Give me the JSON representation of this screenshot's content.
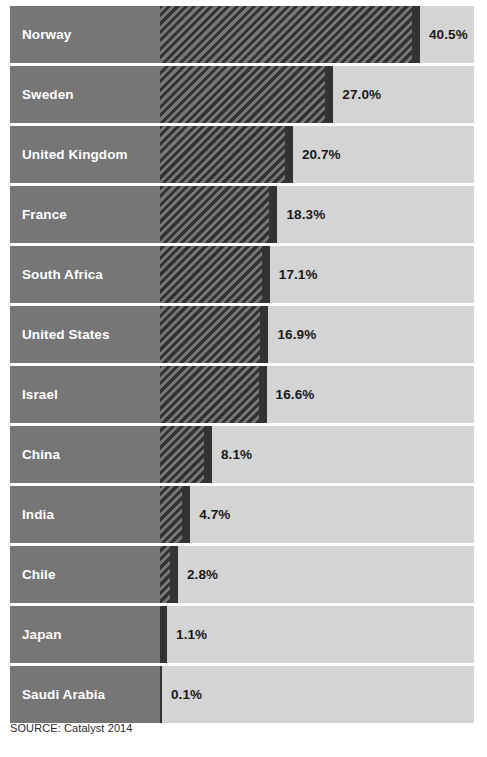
{
  "chart_data": {
    "type": "bar",
    "title": "",
    "subtitle": "",
    "xlabel": "",
    "ylabel": "",
    "orientation": "horizontal",
    "grid": false,
    "legend": null,
    "value_suffix": "%",
    "xlim": [
      0,
      49
    ],
    "categories": [
      "Norway",
      "Sweden",
      "United Kingdom",
      "France",
      "South Africa",
      "United States",
      "Israel",
      "China",
      "India",
      "Chile",
      "Japan",
      "Saudi Arabia"
    ],
    "values": [
      40.5,
      27.0,
      20.7,
      18.3,
      17.1,
      16.9,
      16.6,
      8.1,
      4.7,
      2.8,
      1.1,
      0.1
    ],
    "labels": [
      "40.5%",
      "27.0%",
      "20.7%",
      "18.3%",
      "17.1%",
      "16.9%",
      "16.6%",
      "8.1%",
      "4.7%",
      "2.8%",
      "1.1%",
      "0.1%"
    ],
    "source": "SOURCE: Catalyst 2014"
  },
  "colors": {
    "label_panel": "#767676",
    "track": "#d4d4d4",
    "bar_hatch_dark": "#333333",
    "bar_hatch_light": "#767676",
    "bar_cap": "#333333",
    "label_text": "#ffffff",
    "value_text": "#1a1a1a",
    "background": "#ffffff"
  },
  "rows": [
    {
      "label": "Norway",
      "value": 40.5,
      "value_label": "40.5%"
    },
    {
      "label": "Sweden",
      "value": 27.0,
      "value_label": "27.0%"
    },
    {
      "label": "United Kingdom",
      "value": 20.7,
      "value_label": "20.7%"
    },
    {
      "label": "France",
      "value": 18.3,
      "value_label": "18.3%"
    },
    {
      "label": "South Africa",
      "value": 17.1,
      "value_label": "17.1%"
    },
    {
      "label": "United States",
      "value": 16.9,
      "value_label": "16.9%"
    },
    {
      "label": "Israel",
      "value": 16.6,
      "value_label": "16.6%"
    },
    {
      "label": "China",
      "value": 8.1,
      "value_label": "8.1%"
    },
    {
      "label": "India",
      "value": 4.7,
      "value_label": "4.7%"
    },
    {
      "label": "Chile",
      "value": 2.8,
      "value_label": "2.8%"
    },
    {
      "label": "Japan",
      "value": 1.1,
      "value_label": "1.1%"
    },
    {
      "label": "Saudi Arabia",
      "value": 0.1,
      "value_label": "0.1%"
    }
  ],
  "source_note": "SOURCE: Catalyst 2014"
}
